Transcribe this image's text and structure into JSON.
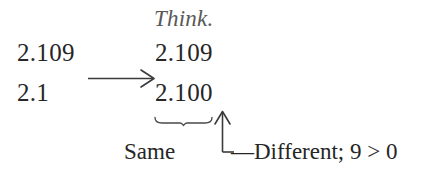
{
  "figure": {
    "title_note": "Think.",
    "left_column": {
      "top_value": "2.109",
      "bottom_value": "2.1"
    },
    "right_column": {
      "top_value": "2.109",
      "bottom_value": "2.100"
    },
    "labels": {
      "same": "Same",
      "different": "—Different; 9 > 0"
    },
    "icons": {
      "transform_arrow": "right-arrow-icon",
      "underbrace": "underbrace-icon",
      "callout_arrow": "up-arrow-icon"
    },
    "colors": {
      "text": "#262626",
      "note": "#585858",
      "rule": "#3a3a3a",
      "background": "#ffffff"
    }
  }
}
